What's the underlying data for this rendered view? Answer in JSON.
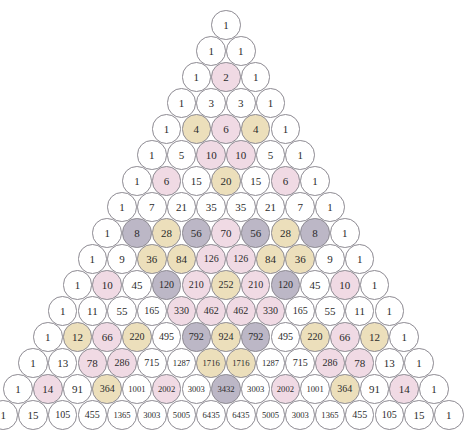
{
  "figure": {
    "name": "pascals-triangle-colored-circles",
    "rows_count": 15,
    "background_color": "#ffffff",
    "circle_outline_color": "#8d8a92",
    "text_color": "#2b2b2b",
    "geometry": {
      "top_center_x": 226,
      "top_center_y": 25,
      "circle_diameter": 29.6,
      "row_step_y": 26.0,
      "col_step_x": 29.7
    },
    "legend_colors": {
      "white": "#ffffff",
      "pink": "#f0dae4",
      "tan": "#ecdfbb",
      "grey": "#bcb7c6"
    }
  },
  "chart_data": {
    "type": "table",
    "xlabel": "",
    "ylabel": "",
    "legend": [
      "white",
      "pink",
      "tan",
      "grey"
    ],
    "rows": [
      {
        "index": 0,
        "values": [
          1
        ],
        "fills": [
          "white"
        ]
      },
      {
        "index": 1,
        "values": [
          1,
          1
        ],
        "fills": [
          "white",
          "white"
        ]
      },
      {
        "index": 2,
        "values": [
          1,
          2,
          1
        ],
        "fills": [
          "white",
          "pink",
          "white"
        ]
      },
      {
        "index": 3,
        "values": [
          1,
          3,
          3,
          1
        ],
        "fills": [
          "white",
          "white",
          "white",
          "white"
        ]
      },
      {
        "index": 4,
        "values": [
          1,
          4,
          6,
          4,
          1
        ],
        "fills": [
          "white",
          "tan",
          "pink",
          "tan",
          "white"
        ]
      },
      {
        "index": 5,
        "values": [
          1,
          5,
          10,
          10,
          5,
          1
        ],
        "fills": [
          "white",
          "white",
          "pink",
          "pink",
          "white",
          "white"
        ]
      },
      {
        "index": 6,
        "values": [
          1,
          6,
          15,
          20,
          15,
          6,
          1
        ],
        "fills": [
          "white",
          "pink",
          "white",
          "tan",
          "white",
          "pink",
          "white"
        ]
      },
      {
        "index": 7,
        "values": [
          1,
          7,
          21,
          35,
          35,
          21,
          7,
          1
        ],
        "fills": [
          "white",
          "white",
          "white",
          "white",
          "white",
          "white",
          "white",
          "white"
        ]
      },
      {
        "index": 8,
        "values": [
          1,
          8,
          28,
          56,
          70,
          56,
          28,
          8,
          1
        ],
        "fills": [
          "white",
          "grey",
          "tan",
          "grey",
          "pink",
          "grey",
          "tan",
          "grey",
          "white"
        ]
      },
      {
        "index": 9,
        "values": [
          1,
          9,
          36,
          84,
          126,
          126,
          84,
          36,
          9,
          1
        ],
        "fills": [
          "white",
          "white",
          "tan",
          "tan",
          "pink",
          "pink",
          "tan",
          "tan",
          "white",
          "white"
        ]
      },
      {
        "index": 10,
        "values": [
          1,
          10,
          45,
          120,
          210,
          252,
          210,
          120,
          45,
          10,
          1
        ],
        "fills": [
          "white",
          "pink",
          "white",
          "grey",
          "pink",
          "tan",
          "pink",
          "grey",
          "white",
          "pink",
          "white"
        ]
      },
      {
        "index": 11,
        "values": [
          1,
          11,
          55,
          165,
          330,
          462,
          462,
          330,
          165,
          55,
          11,
          1
        ],
        "fills": [
          "white",
          "white",
          "white",
          "white",
          "pink",
          "pink",
          "pink",
          "pink",
          "white",
          "white",
          "white",
          "white"
        ]
      },
      {
        "index": 12,
        "values": [
          1,
          12,
          66,
          220,
          495,
          792,
          924,
          792,
          495,
          220,
          66,
          12,
          1
        ],
        "fills": [
          "white",
          "tan",
          "pink",
          "tan",
          "white",
          "grey",
          "tan",
          "grey",
          "white",
          "tan",
          "pink",
          "tan",
          "white"
        ]
      },
      {
        "index": 13,
        "values": [
          1,
          13,
          78,
          286,
          715,
          1287,
          1716,
          1716,
          1287,
          715,
          286,
          78,
          13,
          1
        ],
        "fills": [
          "white",
          "white",
          "pink",
          "pink",
          "white",
          "white",
          "tan",
          "tan",
          "white",
          "white",
          "pink",
          "pink",
          "white",
          "white"
        ]
      },
      {
        "index": 14,
        "values": [
          1,
          14,
          91,
          364,
          1001,
          2002,
          3003,
          3432,
          3003,
          2002,
          1001,
          364,
          91,
          14,
          1
        ],
        "fills": [
          "white",
          "pink",
          "white",
          "tan",
          "white",
          "pink",
          "white",
          "grey",
          "white",
          "pink",
          "white",
          "tan",
          "white",
          "pink",
          "white"
        ]
      },
      {
        "index": 15,
        "values": [
          1,
          15,
          105,
          455,
          1365,
          3003,
          5005,
          6435,
          6435,
          5005,
          3003,
          1365,
          455,
          105,
          15,
          1
        ],
        "fills": [
          "white",
          "white",
          "white",
          "white",
          "white",
          "white",
          "white",
          "white",
          "white",
          "white",
          "white",
          "white",
          "white",
          "white",
          "white",
          "white"
        ]
      }
    ]
  }
}
